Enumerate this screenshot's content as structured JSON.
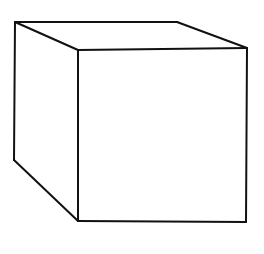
{
  "figure": {
    "description": "Black outline line drawing of a three-dimensional cube shown in oblique perspective, drawn on a plain white background.",
    "shape_name": "cube",
    "style": "hand-drawn black ink outline",
    "background_color": "#ffffff",
    "stroke_color": "#111111",
    "stroke_width": 2.0,
    "canvas": {
      "width": 264,
      "height": 254
    },
    "vertices": {
      "back_top_left": {
        "x": 15,
        "y": 22
      },
      "back_top_right": {
        "x": 177,
        "y": 22
      },
      "back_bottom_left": {
        "x": 14,
        "y": 160
      },
      "front_top_left": {
        "x": 78,
        "y": 50
      },
      "front_top_right": {
        "x": 247,
        "y": 48
      },
      "front_bottom_left": {
        "x": 78,
        "y": 221
      },
      "front_bottom_right": {
        "x": 246,
        "y": 222
      }
    },
    "edges": [
      {
        "name": "top-back-edge",
        "from": "back_top_left",
        "to": "back_top_right"
      },
      {
        "name": "left-back-vertical-edge",
        "from": "back_top_left",
        "to": "back_bottom_left"
      },
      {
        "name": "top-left-receding-edge",
        "from": "back_top_left",
        "to": "front_top_left"
      },
      {
        "name": "top-right-receding-edge",
        "from": "back_top_right",
        "to": "front_top_right"
      },
      {
        "name": "bottom-left-receding-edge",
        "from": "back_bottom_left",
        "to": "front_bottom_left"
      },
      {
        "name": "front-top-edge",
        "from": "front_top_left",
        "to": "front_top_right"
      },
      {
        "name": "front-left-vertical-edge",
        "from": "front_top_left",
        "to": "front_bottom_left"
      },
      {
        "name": "front-bottom-edge",
        "from": "front_bottom_left",
        "to": "front_bottom_right"
      },
      {
        "name": "front-right-vertical-edge",
        "from": "front_top_right",
        "to": "front_bottom_right"
      }
    ],
    "faces": [
      {
        "name": "front-face",
        "points": "78,50 247,48 246,222 78,221"
      },
      {
        "name": "top-face",
        "points": "15,22 177,22 247,48 78,50"
      },
      {
        "name": "left-face",
        "points": "15,22 78,50 78,221 14,160"
      }
    ],
    "labels": [],
    "visible_text": ""
  }
}
